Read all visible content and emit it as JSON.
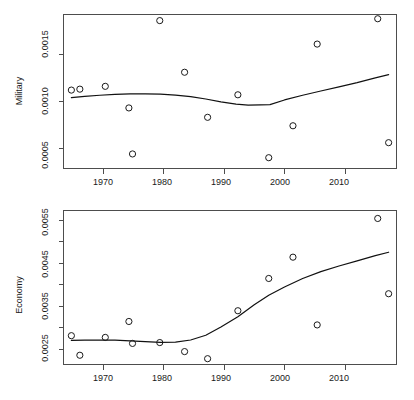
{
  "figure": {
    "title": "",
    "panel_count": 2,
    "background_color": "#ffffff",
    "point_color": "#1a1a1a",
    "line_color": "#111111"
  },
  "chart_data": [
    {
      "type": "scatter",
      "title": "",
      "subtitle": "",
      "xlabel": "",
      "ylabel": "Military",
      "xlim": [
        1963.5,
        2018.5
      ],
      "ylim": [
        0.00028,
        0.00192
      ],
      "grid": false,
      "legend": null,
      "xticks": [
        1970,
        1980,
        1990,
        2000,
        2010
      ],
      "xtick_labels": [
        "1970",
        "1980",
        "1990",
        "2000",
        "2010"
      ],
      "yticks": [
        0.0005,
        0.001,
        0.0015
      ],
      "ytick_labels": [
        "0.0005",
        "0.0010",
        "0.0015"
      ],
      "x": [
        1964.8,
        1966.2,
        1970.4,
        1974.3,
        1974.9,
        1979.4,
        1983.5,
        1987.3,
        1992.3,
        1997.4,
        2001.4,
        2005.4,
        2015.4,
        2017.2
      ],
      "y": [
        0.001115,
        0.001125,
        0.001155,
        0.000925,
        0.000435,
        0.001855,
        0.001305,
        0.000825,
        0.001065,
        0.000395,
        0.000735,
        0.001605,
        0.001875,
        0.000555
      ],
      "series": [
        {
          "name": "Military points",
          "marker": "open-circle",
          "values": [
            0.001115,
            0.001125,
            0.001155,
            0.000925,
            0.000435,
            0.001855,
            0.001305,
            0.000825,
            0.001065,
            0.000395,
            0.000735,
            0.001605,
            0.001875,
            0.000555
          ]
        },
        {
          "name": "Military smooth trend",
          "type": "line",
          "x": [
            1964.8,
            1967.0,
            1969.5,
            1972.0,
            1974.5,
            1977.0,
            1979.5,
            1982.0,
            1984.5,
            1987.0,
            1989.5,
            1992.0,
            1994.0,
            1996.0,
            1997.6,
            2000.0,
            2003.0,
            2006.0,
            2009.0,
            2012.0,
            2015.0,
            2017.2
          ],
          "values": [
            0.001035,
            0.001048,
            0.00106,
            0.00107,
            0.001075,
            0.001075,
            0.001072,
            0.001062,
            0.001045,
            0.00102,
            0.00099,
            0.000965,
            0.000955,
            0.000957,
            0.00096,
            0.00101,
            0.00106,
            0.001105,
            0.00115,
            0.001195,
            0.001245,
            0.00128
          ]
        }
      ]
    },
    {
      "type": "scatter",
      "title": "",
      "subtitle": "",
      "xlabel": "",
      "ylabel": "Economy",
      "xlim": [
        1963.5,
        2018.5
      ],
      "ylim": [
        0.00213,
        0.00571
      ],
      "grid": false,
      "legend": null,
      "xticks": [
        1970,
        1980,
        1990,
        2000,
        2010
      ],
      "xtick_labels": [
        "1970",
        "1980",
        "1990",
        "2000",
        "2010"
      ],
      "yticks": [
        0.0025,
        0.003,
        0.0035,
        0.004,
        0.0045,
        0.005,
        0.0055
      ],
      "ytick_labels": [
        "0.0025",
        "",
        "0.0035",
        "",
        "0.0045",
        "",
        "0.0055"
      ],
      "x": [
        1964.8,
        1966.2,
        1970.4,
        1974.3,
        1974.9,
        1979.4,
        1983.5,
        1987.3,
        1992.3,
        1997.4,
        2001.4,
        2005.4,
        2015.4,
        2017.2
      ],
      "y": [
        0.0028,
        0.002345,
        0.00276,
        0.00313,
        0.00262,
        0.00264,
        0.00243,
        0.002265,
        0.00338,
        0.00413,
        0.004625,
        0.00305,
        0.005525,
        0.003775
      ],
      "series": [
        {
          "name": "Economy points",
          "marker": "open-circle",
          "values": [
            0.0028,
            0.002345,
            0.00276,
            0.00313,
            0.00262,
            0.00264,
            0.00243,
            0.002265,
            0.00338,
            0.00413,
            0.004625,
            0.00305,
            0.005525,
            0.003775
          ]
        },
        {
          "name": "Economy smooth trend",
          "type": "line",
          "x": [
            1964.8,
            1967.0,
            1969.5,
            1972.0,
            1974.5,
            1977.0,
            1979.5,
            1982.0,
            1984.5,
            1987.0,
            1989.5,
            1992.3,
            1995.0,
            1997.4,
            2000.0,
            2003.0,
            2006.0,
            2009.0,
            2012.0,
            2015.0,
            2017.2
          ],
          "values": [
            0.00269,
            0.002695,
            0.0027,
            0.002695,
            0.00268,
            0.00266,
            0.002645,
            0.00265,
            0.0027,
            0.00281,
            0.003,
            0.00324,
            0.00352,
            0.00374,
            0.00393,
            0.00413,
            0.00429,
            0.00442,
            0.00454,
            0.00466,
            0.00474
          ]
        }
      ]
    }
  ]
}
